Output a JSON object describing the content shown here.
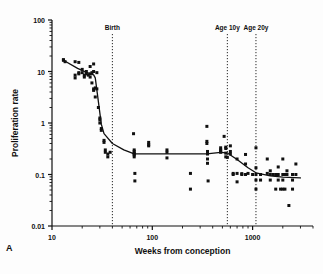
{
  "figure": {
    "panel_label": "A",
    "background": "#fdfdfd",
    "ink_color": "#101010"
  },
  "chart_data": {
    "type": "scatter",
    "title": "",
    "xlabel": "Weeks from conception",
    "ylabel": "Proliferation rate",
    "xscale": "log",
    "yscale": "log",
    "xlim": [
      10,
      4000
    ],
    "ylim": [
      0.01,
      100
    ],
    "xticks": [
      10,
      100,
      1000
    ],
    "xticklabels": [
      "10",
      "100",
      "1000"
    ],
    "yticks": [
      0.01,
      0.1,
      1,
      10,
      100
    ],
    "yticklabels": [
      "0.01",
      "0.1",
      "1",
      "10",
      "100"
    ],
    "grid": false,
    "legend": null,
    "annotations": [
      {
        "label": "Birth",
        "x": 40,
        "style": "dotted-vertical"
      },
      {
        "label": "Age 10y",
        "x": 560,
        "style": "dotted-vertical"
      },
      {
        "label": "Age 20y",
        "x": 1080,
        "style": "dotted-vertical"
      }
    ],
    "series": [
      {
        "name": "Proliferation rate measurements",
        "marker": "square",
        "points": [
          [
            13,
            17
          ],
          [
            13,
            16.5
          ],
          [
            13.5,
            15.5
          ],
          [
            17,
            15.5
          ],
          [
            17,
            8.5
          ],
          [
            17,
            7.5
          ],
          [
            18.5,
            15
          ],
          [
            18.5,
            9.5
          ],
          [
            18.5,
            9
          ],
          [
            20,
            11
          ],
          [
            20,
            9.5
          ],
          [
            21,
            8.5
          ],
          [
            21,
            7.8
          ],
          [
            22,
            10
          ],
          [
            22,
            9
          ],
          [
            23,
            8.5
          ],
          [
            24,
            12.5
          ],
          [
            24,
            9
          ],
          [
            24,
            7.8
          ],
          [
            25,
            9.5
          ],
          [
            25,
            6.0
          ],
          [
            26,
            14
          ],
          [
            26,
            10
          ],
          [
            26,
            4.6
          ],
          [
            26,
            4.3
          ],
          [
            27,
            3.2
          ],
          [
            27,
            4.8
          ],
          [
            28,
            9.5
          ],
          [
            28,
            4.6
          ],
          [
            29,
            2.0
          ],
          [
            30,
            1.25
          ],
          [
            30,
            1.15
          ],
          [
            30,
            1.0
          ],
          [
            31,
            0.78
          ],
          [
            31,
            0.72
          ],
          [
            33,
            0.46
          ],
          [
            33,
            0.42
          ],
          [
            34,
            0.3
          ],
          [
            34,
            0.27
          ],
          [
            36,
            0.25
          ],
          [
            36,
            0.22
          ],
          [
            38,
            0.27
          ],
          [
            65,
            0.62
          ],
          [
            66,
            0.3
          ],
          [
            66,
            0.28
          ],
          [
            66,
            0.26
          ],
          [
            66,
            0.25
          ],
          [
            66,
            0.24
          ],
          [
            66,
            0.22
          ],
          [
            67,
            0.105
          ],
          [
            67,
            0.075
          ],
          [
            92,
            0.42
          ],
          [
            92,
            0.38
          ],
          [
            92,
            0.36
          ],
          [
            140,
            0.3
          ],
          [
            140,
            0.27
          ],
          [
            140,
            0.21
          ],
          [
            240,
            0.105
          ],
          [
            240,
            0.052
          ],
          [
            350,
            0.86
          ],
          [
            350,
            0.44
          ],
          [
            350,
            0.4
          ],
          [
            355,
            0.28
          ],
          [
            355,
            0.25
          ],
          [
            355,
            0.2
          ],
          [
            355,
            0.165
          ],
          [
            360,
            0.075
          ],
          [
            480,
            0.33
          ],
          [
            480,
            0.3
          ],
          [
            480,
            0.29
          ],
          [
            480,
            0.27
          ],
          [
            520,
            0.55
          ],
          [
            540,
            0.34
          ],
          [
            540,
            0.32
          ],
          [
            540,
            0.26
          ],
          [
            540,
            0.22
          ],
          [
            560,
            0.215
          ],
          [
            600,
            0.36
          ],
          [
            600,
            0.28
          ],
          [
            600,
            0.25
          ],
          [
            640,
            0.105
          ],
          [
            640,
            0.1
          ],
          [
            700,
            0.2
          ],
          [
            700,
            0.105
          ],
          [
            700,
            0.072
          ],
          [
            780,
            0.104
          ],
          [
            780,
            0.1
          ],
          [
            850,
            0.245
          ],
          [
            850,
            0.16
          ],
          [
            850,
            0.1
          ],
          [
            900,
            0.105
          ],
          [
            1000,
            0.1
          ],
          [
            1080,
            0.33
          ],
          [
            1080,
            0.135
          ],
          [
            1080,
            0.1
          ],
          [
            1080,
            0.078
          ],
          [
            1080,
            0.052
          ],
          [
            1200,
            0.1
          ],
          [
            1200,
            0.078
          ],
          [
            1400,
            0.2
          ],
          [
            1400,
            0.105
          ],
          [
            1500,
            0.118
          ],
          [
            1500,
            0.1
          ],
          [
            1500,
            0.078
          ],
          [
            1600,
            0.1
          ],
          [
            1700,
            0.1
          ],
          [
            1700,
            0.052
          ],
          [
            1800,
            0.14
          ],
          [
            1800,
            0.1
          ],
          [
            1800,
            0.078
          ],
          [
            1900,
            0.052
          ],
          [
            2000,
            0.2
          ],
          [
            2000,
            0.1
          ],
          [
            2000,
            0.078
          ],
          [
            2000,
            0.052
          ],
          [
            2100,
            0.1
          ],
          [
            2100,
            0.052
          ],
          [
            2200,
            0.118
          ],
          [
            2200,
            0.1
          ],
          [
            2300,
            0.025
          ],
          [
            2500,
            0.1
          ],
          [
            2500,
            0.078
          ],
          [
            2500,
            0.052
          ],
          [
            2700,
            0.16
          ],
          [
            2700,
            0.1
          ]
        ]
      }
    ],
    "fit_line": {
      "name": "Segmented fitted trend",
      "points": [
        [
          13,
          16.5
        ],
        [
          18,
          11.5
        ],
        [
          22,
          9.6
        ],
        [
          26,
          8.6
        ],
        [
          27,
          7.5
        ],
        [
          29,
          2.6
        ],
        [
          31,
          0.95
        ],
        [
          33,
          0.62
        ],
        [
          40,
          0.4
        ],
        [
          52,
          0.3
        ],
        [
          66,
          0.252
        ],
        [
          140,
          0.252
        ],
        [
          350,
          0.252
        ],
        [
          480,
          0.268
        ],
        [
          560,
          0.262
        ],
        [
          700,
          0.195
        ],
        [
          900,
          0.135
        ],
        [
          1080,
          0.108
        ],
        [
          1500,
          0.094
        ],
        [
          2000,
          0.089
        ],
        [
          3000,
          0.086
        ]
      ]
    }
  }
}
